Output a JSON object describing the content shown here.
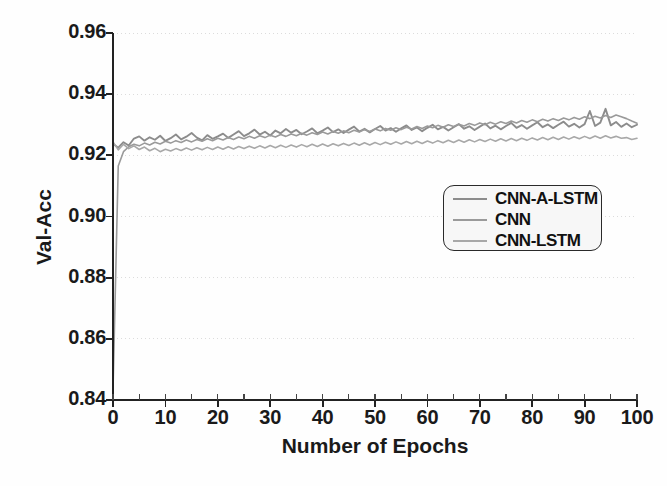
{
  "chart_data": {
    "type": "line",
    "title": "",
    "xlabel": "Number of Epochs",
    "ylabel": "Val-Acc",
    "xlim": [
      0,
      100
    ],
    "ylim": [
      0.84,
      0.96
    ],
    "xticks": [
      0,
      10,
      20,
      30,
      40,
      50,
      60,
      70,
      80,
      90,
      100
    ],
    "xtick_labels": [
      "0",
      "10",
      "20",
      "30",
      "40",
      "50",
      "60",
      "70",
      "80",
      "90",
      "100"
    ],
    "yticks": [
      0.84,
      0.86,
      0.88,
      0.9,
      0.92,
      0.94,
      0.96
    ],
    "ytick_labels": [
      "0.84",
      "0.86",
      "0.88",
      "0.90",
      "0.92",
      "0.94",
      "0.96"
    ],
    "xminor_step": 5,
    "grid": true,
    "grid_axis": "y",
    "legend_position": "center-right",
    "x": [
      0,
      1,
      2,
      3,
      4,
      5,
      6,
      7,
      8,
      9,
      10,
      11,
      12,
      13,
      14,
      15,
      16,
      17,
      18,
      19,
      20,
      21,
      22,
      23,
      24,
      25,
      26,
      27,
      28,
      29,
      30,
      31,
      32,
      33,
      34,
      35,
      36,
      37,
      38,
      39,
      40,
      41,
      42,
      43,
      44,
      45,
      46,
      47,
      48,
      49,
      50,
      51,
      52,
      53,
      54,
      55,
      56,
      57,
      58,
      59,
      60,
      61,
      62,
      63,
      64,
      65,
      66,
      67,
      68,
      69,
      70,
      71,
      72,
      73,
      74,
      75,
      76,
      77,
      78,
      79,
      80,
      81,
      82,
      83,
      84,
      85,
      86,
      87,
      88,
      89,
      90,
      91,
      92,
      93,
      94,
      95,
      96,
      97,
      98,
      99,
      100
    ],
    "series": [
      {
        "name": "CNN-A-LSTM",
        "color": "#8c8c8c",
        "values": [
          0.9238,
          0.9225,
          0.9243,
          0.9232,
          0.9255,
          0.9262,
          0.9248,
          0.9259,
          0.9251,
          0.9264,
          0.9247,
          0.9256,
          0.9268,
          0.9252,
          0.9261,
          0.9273,
          0.9258,
          0.9249,
          0.9266,
          0.9254,
          0.9262,
          0.9271,
          0.9257,
          0.9268,
          0.9279,
          0.9263,
          0.9272,
          0.9284,
          0.9268,
          0.9277,
          0.9265,
          0.9281,
          0.9272,
          0.9286,
          0.9274,
          0.9283,
          0.9269,
          0.9278,
          0.9288,
          0.9272,
          0.9281,
          0.9291,
          0.9276,
          0.9285,
          0.9273,
          0.9284,
          0.9294,
          0.9278,
          0.9287,
          0.9275,
          0.9286,
          0.9296,
          0.9281,
          0.9289,
          0.9277,
          0.9288,
          0.9298,
          0.9283,
          0.9291,
          0.9279,
          0.929,
          0.93,
          0.9285,
          0.9293,
          0.9281,
          0.9292,
          0.9302,
          0.9287,
          0.9295,
          0.9283,
          0.9294,
          0.9304,
          0.9288,
          0.9297,
          0.9285,
          0.9296,
          0.9306,
          0.929,
          0.9299,
          0.9287,
          0.9298,
          0.9308,
          0.9292,
          0.9301,
          0.9289,
          0.93,
          0.931,
          0.9294,
          0.9303,
          0.9291,
          0.9302,
          0.9345,
          0.9296,
          0.9307,
          0.9352,
          0.9298,
          0.9309,
          0.9293,
          0.9304,
          0.9292,
          0.93
        ]
      },
      {
        "name": "CNN",
        "color": "#9a9a9a",
        "values": [
          0.8432,
          0.9165,
          0.9212,
          0.9228,
          0.9236,
          0.9231,
          0.924,
          0.9234,
          0.9243,
          0.9237,
          0.9246,
          0.924,
          0.9248,
          0.9242,
          0.925,
          0.9244,
          0.9252,
          0.9246,
          0.9254,
          0.9248,
          0.9256,
          0.925,
          0.9258,
          0.9252,
          0.926,
          0.9254,
          0.9262,
          0.9256,
          0.9264,
          0.9258,
          0.9266,
          0.926,
          0.9268,
          0.9262,
          0.927,
          0.9264,
          0.9272,
          0.9266,
          0.9274,
          0.9268,
          0.9276,
          0.927,
          0.9278,
          0.9272,
          0.928,
          0.9274,
          0.9282,
          0.9276,
          0.9284,
          0.9278,
          0.9286,
          0.928,
          0.9288,
          0.9282,
          0.929,
          0.9284,
          0.9292,
          0.9286,
          0.9294,
          0.9288,
          0.9296,
          0.929,
          0.9298,
          0.9292,
          0.93,
          0.9294,
          0.9302,
          0.9296,
          0.9304,
          0.9298,
          0.9306,
          0.93,
          0.9308,
          0.9302,
          0.931,
          0.9304,
          0.9312,
          0.9306,
          0.9314,
          0.9308,
          0.9316,
          0.931,
          0.9318,
          0.9312,
          0.932,
          0.9314,
          0.9322,
          0.9316,
          0.9324,
          0.9318,
          0.9326,
          0.932,
          0.9328,
          0.9322,
          0.933,
          0.9324,
          0.9332,
          0.9326,
          0.932,
          0.9312,
          0.9305
        ]
      },
      {
        "name": "CNN-LSTM",
        "color": "#a8a8a8",
        "values": [
          0.9244,
          0.9218,
          0.9236,
          0.9222,
          0.9231,
          0.9219,
          0.9227,
          0.9215,
          0.9223,
          0.9212,
          0.922,
          0.9214,
          0.9222,
          0.9216,
          0.9224,
          0.9217,
          0.9225,
          0.9218,
          0.9226,
          0.9219,
          0.9227,
          0.922,
          0.9228,
          0.9221,
          0.9229,
          0.9222,
          0.923,
          0.9223,
          0.9231,
          0.9224,
          0.9232,
          0.9225,
          0.9233,
          0.9226,
          0.9234,
          0.9227,
          0.9235,
          0.9228,
          0.9236,
          0.9229,
          0.9237,
          0.923,
          0.9238,
          0.9231,
          0.9239,
          0.9232,
          0.924,
          0.9233,
          0.9241,
          0.9234,
          0.9242,
          0.9235,
          0.9243,
          0.9236,
          0.9244,
          0.9237,
          0.9245,
          0.9238,
          0.9246,
          0.9239,
          0.9247,
          0.924,
          0.9248,
          0.9241,
          0.9249,
          0.9242,
          0.925,
          0.9243,
          0.9251,
          0.9244,
          0.9252,
          0.9245,
          0.9253,
          0.9246,
          0.9254,
          0.9247,
          0.9255,
          0.9248,
          0.9256,
          0.9249,
          0.9257,
          0.925,
          0.9258,
          0.9251,
          0.9259,
          0.9252,
          0.926,
          0.9253,
          0.9261,
          0.9254,
          0.9262,
          0.9255,
          0.9263,
          0.9256,
          0.9264,
          0.9257,
          0.9262,
          0.9256,
          0.9258,
          0.9252,
          0.9256
        ]
      }
    ]
  },
  "legend": {
    "items": [
      {
        "label": "CNN-A-LSTM"
      },
      {
        "label": "CNN"
      },
      {
        "label": "CNN-LSTM"
      }
    ]
  },
  "axes": {
    "x_title": "Number of Epochs",
    "y_title": "Val-Acc"
  }
}
